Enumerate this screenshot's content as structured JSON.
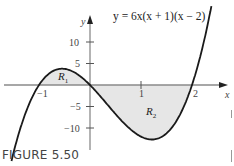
{
  "figure": {
    "caption": "FIGURE 5.50",
    "equation": "y = 6x(x + 1)(x − 2)"
  },
  "axes": {
    "x_label": "x",
    "y_label": "y",
    "x_ticks": [
      {
        "value": -1,
        "label": "−1"
      },
      {
        "value": 1,
        "label": "1"
      },
      {
        "value": 2,
        "label": "2"
      }
    ],
    "y_ticks": [
      {
        "value": 10,
        "label": "10"
      },
      {
        "value": 5,
        "label": "5"
      },
      {
        "value": -5,
        "label": "−5"
      },
      {
        "value": -10,
        "label": "−10"
      }
    ]
  },
  "regions": [
    {
      "name": "R1",
      "label_main": "R",
      "label_sub": "1",
      "interval": [
        -1,
        0
      ]
    },
    {
      "name": "R2",
      "label_main": "R",
      "label_sub": "2",
      "interval": [
        0,
        2
      ]
    }
  ],
  "colors": {
    "curve": "#1a1a1a",
    "axis": "#8a8a8a",
    "shade": "#e6e6e6",
    "caption": "#444444"
  },
  "chart_data": {
    "type": "line",
    "title": "y = 6x(x + 1)(x − 2)",
    "xlabel": "x",
    "ylabel": "y",
    "xlim": [
      -1.75,
      2.8
    ],
    "ylim": [
      -13,
      15
    ],
    "function": "6*x*(x+1)*(x-2)",
    "roots": [
      -1,
      0,
      2
    ],
    "x": [
      -1.5,
      -1.25,
      -1,
      -0.75,
      -0.5,
      -0.25,
      0,
      0.25,
      0.5,
      0.75,
      1,
      1.25,
      1.5,
      1.75,
      2,
      2.2
    ],
    "values": [
      -15.75,
      -6.09,
      0,
      3.09,
      3.75,
      2.72,
      0,
      -3.28,
      -7.5,
      -10.7,
      -12,
      -11.34,
      -6.75,
      -3.94,
      0,
      6.86
    ],
    "shaded_regions": [
      {
        "name": "R1",
        "x_range": [
          -1,
          0
        ],
        "side": "above x-axis"
      },
      {
        "name": "R2",
        "x_range": [
          0,
          2
        ],
        "side": "below x-axis"
      }
    ],
    "x_ticks": [
      -1,
      1,
      2
    ],
    "y_ticks": [
      -10,
      -5,
      5,
      10
    ],
    "grid": false,
    "annotations": [
      "R1",
      "R2",
      "y = 6x(x + 1)(x − 2)"
    ]
  }
}
